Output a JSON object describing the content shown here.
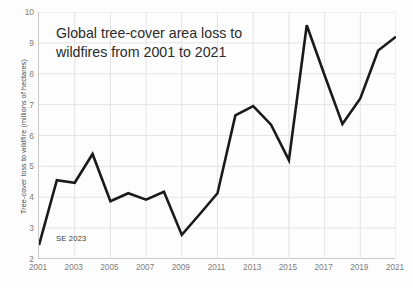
{
  "chart_data": {
    "type": "line",
    "title": "Global tree-cover area loss to wildfires from 2001 to 2021",
    "title_line1": "Global tree-cover area loss to",
    "title_line2": "wildfires from 2001 to 2021",
    "xlabel": "",
    "ylabel": "Tree-cover loss to wildfire (millions of hectares)",
    "annotation": "SE 2023",
    "xlim": [
      2001,
      2021
    ],
    "ylim": [
      2,
      10
    ],
    "grid": true,
    "legend": null,
    "line_color": "#1a1a1a",
    "grid_color": "#e4e4e4",
    "axis_color": "#c9c9c9",
    "x": [
      2001,
      2002,
      2003,
      2004,
      2005,
      2006,
      2007,
      2008,
      2009,
      2010,
      2011,
      2012,
      2013,
      2014,
      2015,
      2016,
      2017,
      2018,
      2019,
      2020,
      2021
    ],
    "values": [
      2.45,
      4.55,
      4.47,
      5.4,
      3.87,
      4.13,
      3.92,
      4.18,
      2.78,
      3.45,
      4.13,
      6.65,
      6.95,
      6.35,
      5.2,
      9.57,
      7.95,
      6.37,
      7.2,
      8.75,
      9.2
    ],
    "xticks": [
      2001,
      2003,
      2005,
      2007,
      2009,
      2011,
      2013,
      2015,
      2017,
      2019,
      2021
    ],
    "xtick_labels": [
      "2001",
      "2003",
      "2005",
      "2007",
      "2009",
      "2011",
      "2013",
      "2015",
      "2017",
      "2019",
      "2021"
    ],
    "yticks": [
      2,
      3,
      4,
      5,
      6,
      7,
      8,
      9,
      10
    ],
    "ytick_labels": [
      "2",
      "3",
      "4",
      "5",
      "6",
      "7",
      "8",
      "9",
      "10"
    ]
  }
}
